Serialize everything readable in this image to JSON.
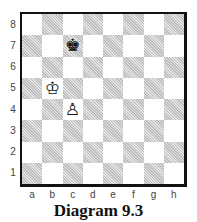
{
  "diagram": {
    "caption": "Diagram 9.3",
    "colors": {
      "border": "#111111",
      "light_square": "#ffffff",
      "dark_square": "#d6d6d6",
      "label": "#444444"
    },
    "ranks": [
      "8",
      "7",
      "6",
      "5",
      "4",
      "3",
      "2",
      "1"
    ],
    "files": [
      "a",
      "b",
      "c",
      "d",
      "e",
      "f",
      "g",
      "h"
    ],
    "pieces": [
      {
        "square": "c7",
        "piece": "black-king",
        "glyph": "♚"
      },
      {
        "square": "b5",
        "piece": "white-king",
        "glyph": "♔"
      },
      {
        "square": "c4",
        "piece": "white-pawn",
        "glyph": "♙"
      }
    ]
  }
}
